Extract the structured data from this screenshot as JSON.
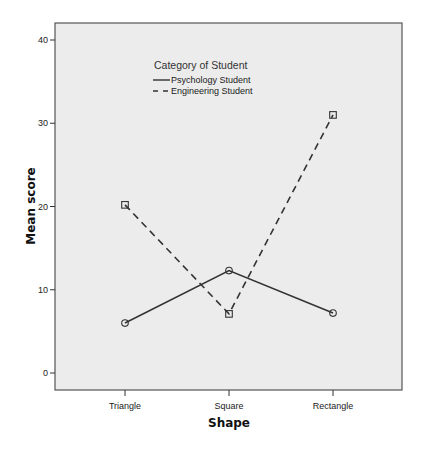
{
  "chart_data": {
    "type": "line",
    "title": "",
    "xlabel": "Shape",
    "ylabel": "Mean score",
    "categories": [
      "Triangle",
      "Square",
      "Rectangle"
    ],
    "series": [
      {
        "name": "Psychology Student",
        "values": [
          6.0,
          12.3,
          7.2
        ],
        "line_style": "solid",
        "marker": "circle"
      },
      {
        "name": "Engineering Student",
        "values": [
          20.2,
          7.1,
          31.0
        ],
        "line_style": "dashed",
        "marker": "square"
      }
    ],
    "ylim": [
      -2,
      42
    ],
    "yticks": [
      0,
      10,
      20,
      30,
      40
    ],
    "ytick_labels": [
      "0",
      "10",
      "20",
      "30",
      "40"
    ],
    "grid": false,
    "legend": {
      "title": "Category of Student",
      "position": "inside-top-center",
      "entries": [
        "Psychology Student",
        "Engineering Student"
      ]
    },
    "colors": {
      "plot_background": "#ececec",
      "line": "#333333",
      "frame": "#555555"
    }
  }
}
